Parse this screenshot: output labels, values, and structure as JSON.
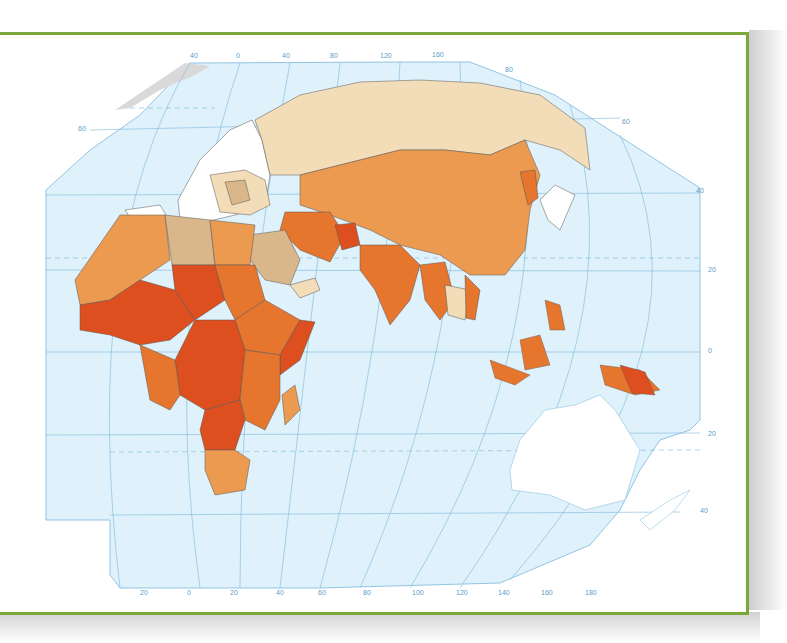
{
  "map": {
    "type": "choropleth-world-map",
    "region": "Europe, Africa, Asia, Oceania",
    "frame_color": "#7aa83a",
    "ocean_color": "#dff1fa",
    "graticule_color": "#7ab8dd",
    "label_color": "#5b9bc9",
    "top_longitude_labels": [
      "40",
      "0",
      "40",
      "80",
      "120",
      "160"
    ],
    "bottom_longitude_labels": [
      "20",
      "0",
      "20",
      "40",
      "60",
      "80",
      "100",
      "120",
      "140",
      "160",
      "180"
    ],
    "left_latitude_labels": [
      "60"
    ],
    "right_latitude_labels": [
      "80",
      "60",
      "40",
      "20",
      "0",
      "20",
      "40"
    ],
    "legend_classes": [
      {
        "name": "no-data",
        "color": "#ffffff"
      },
      {
        "name": "very-low",
        "color": "#f3ddb8"
      },
      {
        "name": "low",
        "color": "#d9b78a"
      },
      {
        "name": "medium",
        "color": "#eb9a4f"
      },
      {
        "name": "high",
        "color": "#e6752e"
      },
      {
        "name": "very-high",
        "color": "#dd4f1e"
      },
      {
        "name": "greenland",
        "color": "#d9d9d9"
      }
    ]
  }
}
